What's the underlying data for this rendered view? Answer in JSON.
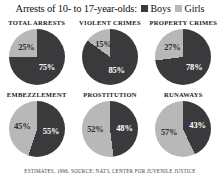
{
  "header": {
    "title": "Arrests of 10- to 17-year-olds:",
    "legend": [
      {
        "label": "Boys",
        "swatch": "boys-swatch",
        "color": "#3a3a3c"
      },
      {
        "label": "Girls",
        "swatch": "girls-swatch",
        "color": "#b8b8b8"
      }
    ]
  },
  "footer": {
    "source": "ESTIMATES, 1996. SOURCE: NAT'L CENTER FOR JUVENILE JUSTICE"
  },
  "chart_data": {
    "type": "pie",
    "title": "Arrests of 10- to 17-year-olds:",
    "legend": [
      "Boys",
      "Girls"
    ],
    "legend_position": "top-right",
    "colors": {
      "Boys": "#3a3a3c",
      "Girls": "#b8b8b8"
    },
    "series": [
      {
        "name": "TOTAL ARRESTS",
        "slices": [
          {
            "label": "Girls",
            "value": 25,
            "display": "25%"
          },
          {
            "label": "Boys",
            "value": 75,
            "display": "75%"
          }
        ]
      },
      {
        "name": "VIOLENT CRIMES",
        "slices": [
          {
            "label": "Girls",
            "value": 15,
            "display": "15%"
          },
          {
            "label": "Boys",
            "value": 85,
            "display": "85%"
          }
        ]
      },
      {
        "name": "PROPERTY CRIMES",
        "slices": [
          {
            "label": "Girls",
            "value": 27,
            "display": "27%"
          },
          {
            "label": "Boys",
            "value": 73,
            "display": "78%"
          }
        ]
      },
      {
        "name": "EMBEZZLEMENT",
        "slices": [
          {
            "label": "Girls",
            "value": 45,
            "display": "45%"
          },
          {
            "label": "Boys",
            "value": 55,
            "display": "55%"
          }
        ]
      },
      {
        "name": "PROSTITUTION",
        "slices": [
          {
            "label": "Girls",
            "value": 52,
            "display": "52%"
          },
          {
            "label": "Boys",
            "value": 48,
            "display": "48%"
          }
        ]
      },
      {
        "name": "RUNAWAYS",
        "slices": [
          {
            "label": "Girls",
            "value": 57,
            "display": "57%"
          },
          {
            "label": "Boys",
            "value": 43,
            "display": "43%"
          }
        ]
      }
    ]
  }
}
